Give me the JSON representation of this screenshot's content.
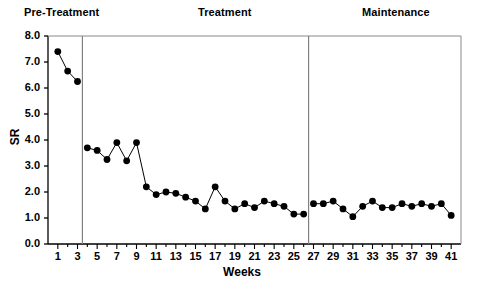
{
  "chart_data": {
    "type": "line",
    "title": "",
    "xlabel": "Weeks",
    "ylabel": "SR",
    "xlim": [
      0,
      42
    ],
    "ylim": [
      0.0,
      8.0
    ],
    "grid": false,
    "legend": null,
    "yticks": [
      "0.0",
      "1.0",
      "2.0",
      "3.0",
      "4.0",
      "5.0",
      "6.0",
      "7.0",
      "8.0"
    ],
    "xticks": [
      "1",
      "3",
      "5",
      "7",
      "9",
      "11",
      "13",
      "15",
      "17",
      "19",
      "21",
      "23",
      "25",
      "27",
      "29",
      "31",
      "33",
      "35",
      "37",
      "39",
      "41"
    ],
    "xtick_minor_step": 1,
    "marker": "filled-circle",
    "line_color": "#000000",
    "marker_color": "#000000",
    "axis_color": "#000000",
    "phase_divider_color": "#808080",
    "phase_labels": [
      {
        "name": "pre-treatment",
        "text": "Pre-Treatment"
      },
      {
        "name": "treatment",
        "text": "Treatment"
      },
      {
        "name": "maintenance",
        "text": "Maintenance"
      }
    ],
    "phase_dividers_after_week": [
      3,
      26
    ],
    "series": [
      {
        "name": "SR",
        "x": [
          1,
          2,
          3,
          4,
          5,
          6,
          7,
          8,
          9,
          10,
          11,
          12,
          13,
          14,
          15,
          16,
          17,
          18,
          19,
          20,
          21,
          22,
          23,
          24,
          25,
          26,
          27,
          28,
          29,
          30,
          31,
          32,
          33,
          34,
          35,
          36,
          37,
          38,
          39,
          40,
          41
        ],
        "values": [
          7.4,
          6.65,
          6.25,
          3.7,
          3.6,
          3.25,
          3.9,
          3.2,
          3.9,
          2.2,
          1.9,
          2.0,
          1.95,
          1.8,
          1.65,
          1.35,
          2.2,
          1.65,
          1.35,
          1.55,
          1.4,
          1.65,
          1.55,
          1.45,
          1.15,
          1.15,
          1.55,
          1.55,
          1.65,
          1.35,
          1.05,
          1.45,
          1.65,
          1.4,
          1.4,
          1.55,
          1.45,
          1.55,
          1.45,
          1.55,
          1.1
        ],
        "segments": [
          [
            1,
            2,
            3
          ],
          [
            4,
            5,
            6,
            7,
            8,
            9,
            10,
            11,
            12,
            13,
            14,
            15,
            16,
            17,
            18,
            19,
            20,
            21,
            22,
            23,
            24,
            25,
            26
          ],
          [
            27,
            28,
            29,
            30,
            31,
            32,
            33,
            34,
            35,
            36,
            37,
            38,
            39,
            40,
            41
          ]
        ]
      }
    ]
  }
}
